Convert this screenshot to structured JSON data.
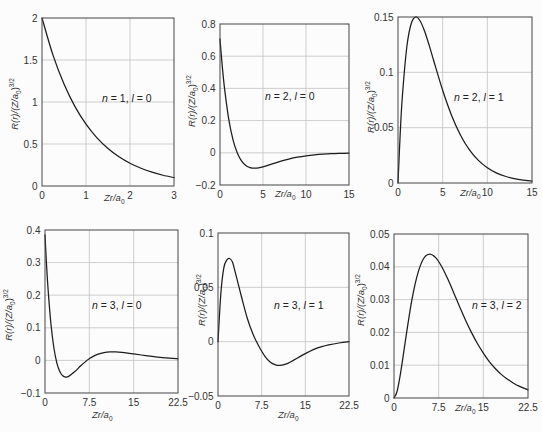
{
  "colors": {
    "background": "#fcfcfc",
    "curve": "#1c1c1c",
    "grid": "#c3c3c3",
    "frame": "#454545",
    "text": "#333333"
  },
  "chart_data": [
    {
      "type": "line",
      "title": "n = 1, l = 0",
      "annotation": {
        "n_sym": "n",
        "eq1": " = ",
        "n": "1",
        "sep": ", ",
        "l_sym": "l",
        "eq2": " = ",
        "l": "0"
      },
      "xlabel": {
        "main": "Zr/a",
        "sub": "0"
      },
      "ylabel": {
        "main": "R(r)/(Z/a",
        "sub": "0",
        "close": ")",
        "sup": "3/2"
      },
      "xlim": [
        0,
        3
      ],
      "ylim": [
        0,
        2
      ],
      "xticks": [
        0,
        1,
        2,
        3
      ],
      "xtick_labels": [
        "0",
        "1",
        "2",
        "3"
      ],
      "yticks": [
        0,
        0.5,
        1,
        1.5,
        2
      ],
      "ytick_labels": [
        "0",
        "0.5",
        "1",
        "1.5",
        "2"
      ],
      "grid": true,
      "series": [
        {
          "name": "R(1,0)",
          "x": [
            0,
            0.25,
            0.5,
            0.75,
            1,
            1.25,
            1.5,
            1.75,
            2,
            2.25,
            2.5,
            2.75,
            3
          ],
          "y": [
            2.0,
            1.5576,
            1.2131,
            0.9447,
            0.7358,
            0.573,
            0.4463,
            0.3475,
            0.2707,
            0.2108,
            0.1642,
            0.1279,
            0.0996
          ]
        }
      ]
    },
    {
      "type": "line",
      "title": "n = 2, l = 0",
      "annotation": {
        "n_sym": "n",
        "eq1": " = ",
        "n": "2",
        "sep": ", ",
        "l_sym": "l",
        "eq2": " = ",
        "l": "0"
      },
      "xlabel": {
        "main": "Zr/a",
        "sub": "0"
      },
      "ylabel": {
        "main": "R(r)/(Z/a",
        "sub": "0",
        "close": ")",
        "sup": "3/2"
      },
      "xlim": [
        0,
        15
      ],
      "ylim": [
        -0.2,
        0.8
      ],
      "xticks": [
        0,
        5,
        10,
        15
      ],
      "xtick_labels": [
        "0",
        "5",
        "10",
        "15"
      ],
      "yticks": [
        -0.2,
        0,
        0.2,
        0.4,
        0.6,
        0.8
      ],
      "ytick_labels": [
        "−0.2",
        "0",
        "0.2",
        "0.4",
        "0.6",
        "0.8"
      ],
      "grid": true,
      "series": [
        {
          "name": "R(2,0)",
          "x": [
            0,
            0.25,
            0.5,
            1,
            1.5,
            2,
            2.5,
            3,
            3.5,
            4,
            4.5,
            5,
            6,
            7,
            8,
            9,
            10,
            11,
            12,
            13,
            14,
            15
          ],
          "y": [
            0.7071,
            0.546,
            0.413,
            0.2144,
            0.0835,
            0,
            -0.0506,
            -0.0789,
            -0.0922,
            -0.0957,
            -0.0932,
            -0.0871,
            -0.0704,
            -0.0534,
            -0.0389,
            -0.0275,
            -0.0191,
            -0.013,
            -0.0088,
            -0.0058,
            -0.0039,
            -0.0025
          ]
        }
      ]
    },
    {
      "type": "line",
      "title": "n = 2, l = 1",
      "annotation": {
        "n_sym": "n",
        "eq1": " = ",
        "n": "2",
        "sep": ", ",
        "l_sym": "l",
        "eq2": " = ",
        "l": "1"
      },
      "xlabel": {
        "main": "Zr/a",
        "sub": "0"
      },
      "ylabel": {
        "main": "R(r)/(Z/a",
        "sub": "0",
        "close": ")",
        "sup": "3/2"
      },
      "xlim": [
        0,
        15
      ],
      "ylim": [
        0,
        0.15
      ],
      "xticks": [
        0,
        5,
        10,
        15
      ],
      "xtick_labels": [
        "0",
        "5",
        "10",
        "15"
      ],
      "yticks": [
        0,
        0.05,
        0.1,
        0.15
      ],
      "ytick_labels": [
        "0",
        "0.05",
        "0.1",
        "0.15"
      ],
      "grid": true,
      "series": [
        {
          "name": "R(2,1)",
          "x": [
            0,
            0.25,
            0.5,
            1,
            1.5,
            2,
            2.5,
            3,
            3.5,
            4,
            5,
            6,
            7,
            8,
            9,
            10,
            11,
            12,
            13,
            14,
            15
          ],
          "y": [
            0,
            0.045,
            0.0795,
            0.1238,
            0.1446,
            0.1502,
            0.1462,
            0.1366,
            0.1241,
            0.1105,
            0.0838,
            0.061,
            0.0432,
            0.0299,
            0.0204,
            0.0138,
            0.0092,
            0.0061,
            0.004,
            0.0026,
            0.0017
          ]
        }
      ]
    },
    {
      "type": "line",
      "title": "n = 3, l = 0",
      "annotation": {
        "n_sym": "n",
        "eq1": " = ",
        "n": "3",
        "sep": ", ",
        "l_sym": "l",
        "eq2": " = ",
        "l": "0"
      },
      "xlabel": {
        "main": "Zr/a",
        "sub": "0"
      },
      "ylabel": {
        "main": "R(r)/(Z/a",
        "sub": "0",
        "close": ")",
        "sup": "3/2"
      },
      "xlim": [
        0,
        22.5
      ],
      "ylim": [
        -0.1,
        0.4
      ],
      "xticks": [
        0,
        7.5,
        15,
        22.5
      ],
      "xtick_labels": [
        "0",
        "7.5",
        "15",
        "22.5"
      ],
      "yticks": [
        -0.1,
        0,
        0.1,
        0.2,
        0.3,
        0.4
      ],
      "ytick_labels": [
        "−0.1",
        "0",
        "0.1",
        "0.2",
        "0.3",
        "0.4"
      ],
      "grid": true,
      "series": [
        {
          "name": "R(3,0)",
          "x": [
            0,
            0.25,
            0.5,
            1,
            1.5,
            2,
            2.5,
            3,
            3.5,
            4,
            5,
            6,
            7,
            7.5,
            8,
            9,
            10,
            11,
            12,
            13,
            14,
            15,
            17,
            19,
            21,
            22.5
          ],
          "y": [
            0.3849,
            0.2967,
            0.2233,
            0.1124,
            0.0389,
            -0.0073,
            -0.0341,
            -0.0472,
            -0.0511,
            -0.0489,
            -0.035,
            -0.0174,
            -0.0014,
            0.0053,
            0.0109,
            0.0192,
            0.0239,
            0.0259,
            0.0258,
            0.0245,
            0.0224,
            0.0199,
            0.0148,
            0.0103,
            0.0069,
            0.005
          ]
        }
      ]
    },
    {
      "type": "line",
      "title": "n = 3, l = 1",
      "annotation": {
        "n_sym": "n",
        "eq1": " = ",
        "n": "3",
        "sep": ", ",
        "l_sym": "l",
        "eq2": " = ",
        "l": "1"
      },
      "xlabel": {
        "main": "Zr/a",
        "sub": "0"
      },
      "ylabel": {
        "main": "R(r)/(Z/a",
        "sub": "0",
        "close": ")",
        "sup": "3/2"
      },
      "xlim": [
        0,
        22.5
      ],
      "ylim": [
        -0.05,
        0.1
      ],
      "xticks": [
        0,
        7.5,
        15,
        22.5
      ],
      "xtick_labels": [
        "0",
        "7.5",
        "15",
        "22.5"
      ],
      "yticks": [
        -0.05,
        0,
        0.05,
        0.1
      ],
      "ytick_labels": [
        "−0.05",
        "0",
        "0.05",
        "0.1"
      ],
      "grid": true,
      "series": [
        {
          "name": "R(3,1)",
          "x": [
            0,
            0.5,
            1,
            1.5,
            2,
            2.5,
            3,
            4,
            5,
            6,
            7,
            8,
            9,
            10,
            11,
            12,
            13,
            14,
            15,
            17,
            19,
            21,
            22.5
          ],
          "y": [
            0,
            0.045,
            0.068,
            0.075,
            0.0765,
            0.073,
            0.063,
            0.042,
            0.022,
            0.007,
            -0.004,
            -0.013,
            -0.019,
            -0.0215,
            -0.0215,
            -0.02,
            -0.017,
            -0.014,
            -0.011,
            -0.006,
            -0.003,
            -0.001,
            0
          ]
        }
      ]
    },
    {
      "type": "line",
      "title": "n = 3, l = 2",
      "annotation": {
        "n_sym": "n",
        "eq1": " = ",
        "n": "3",
        "sep": ", ",
        "l_sym": "l",
        "eq2": " = ",
        "l": "2"
      },
      "xlabel": {
        "main": "Zr/a",
        "sub": "0"
      },
      "ylabel": {
        "main": "R(r)/(Z/a",
        "sub": "0",
        "close": ")",
        "sup": "3/2"
      },
      "xlim": [
        0,
        22.5
      ],
      "ylim": [
        0,
        0.05
      ],
      "xticks": [
        0,
        7.5,
        15,
        22.5
      ],
      "xtick_labels": [
        "0",
        "7.5",
        "15",
        "22.5"
      ],
      "yticks": [
        0,
        0.01,
        0.02,
        0.03,
        0.04,
        0.05
      ],
      "ytick_labels": [
        "0",
        "0.01",
        "0.02",
        "0.03",
        "0.04",
        "0.05"
      ],
      "grid": true,
      "series": [
        {
          "name": "R(3,2)",
          "x": [
            0,
            0.5,
            1,
            1.5,
            2,
            3,
            4,
            5,
            6,
            7,
            8,
            9,
            10,
            11,
            12,
            13,
            14,
            15,
            16,
            17,
            18,
            19,
            20,
            21,
            22.5
          ],
          "y": [
            0,
            0.0019,
            0.0065,
            0.0123,
            0.0185,
            0.0299,
            0.038,
            0.0426,
            0.0439,
            0.0428,
            0.0401,
            0.0364,
            0.0322,
            0.0279,
            0.0238,
            0.02,
            0.0166,
            0.0137,
            0.0111,
            0.009,
            0.0072,
            0.0058,
            0.0046,
            0.0036,
            0.0025
          ]
        }
      ]
    }
  ]
}
